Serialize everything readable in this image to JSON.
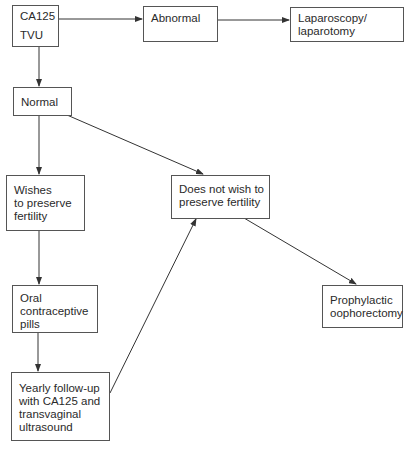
{
  "diagram": {
    "type": "flowchart",
    "nodes": {
      "screening": {
        "lines": [
          "CA125",
          "TVU"
        ]
      },
      "abnormal": {
        "lines": [
          "Abnormal"
        ]
      },
      "surgery": {
        "lines": [
          "Laparoscopy/",
          "laparotomy"
        ]
      },
      "normal": {
        "lines": [
          "Normal"
        ]
      },
      "wishes_fertility": {
        "lines": [
          "Wishes",
          "to preserve",
          "fertility"
        ]
      },
      "no_fertility": {
        "lines": [
          "Does not wish to",
          "preserve fertility"
        ]
      },
      "ocp": {
        "lines": [
          "Oral",
          "contraceptive",
          "pills"
        ]
      },
      "oophorectomy": {
        "lines": [
          "Prophylactic",
          "oophorectomy"
        ]
      },
      "followup": {
        "lines": [
          "Yearly follow-up",
          "with CA125 and",
          "transvaginal",
          "ultrasound"
        ]
      }
    },
    "edges": [
      {
        "from": "screening",
        "to": "abnormal"
      },
      {
        "from": "abnormal",
        "to": "surgery"
      },
      {
        "from": "screening",
        "to": "normal"
      },
      {
        "from": "normal",
        "to": "wishes_fertility"
      },
      {
        "from": "normal",
        "to": "no_fertility"
      },
      {
        "from": "wishes_fertility",
        "to": "ocp"
      },
      {
        "from": "ocp",
        "to": "followup"
      },
      {
        "from": "followup",
        "to": "no_fertility"
      },
      {
        "from": "no_fertility",
        "to": "oophorectomy"
      }
    ],
    "colors": {
      "line": "#333333",
      "border": "#555555",
      "text": "#2a2a2a",
      "background": "#ffffff"
    }
  }
}
